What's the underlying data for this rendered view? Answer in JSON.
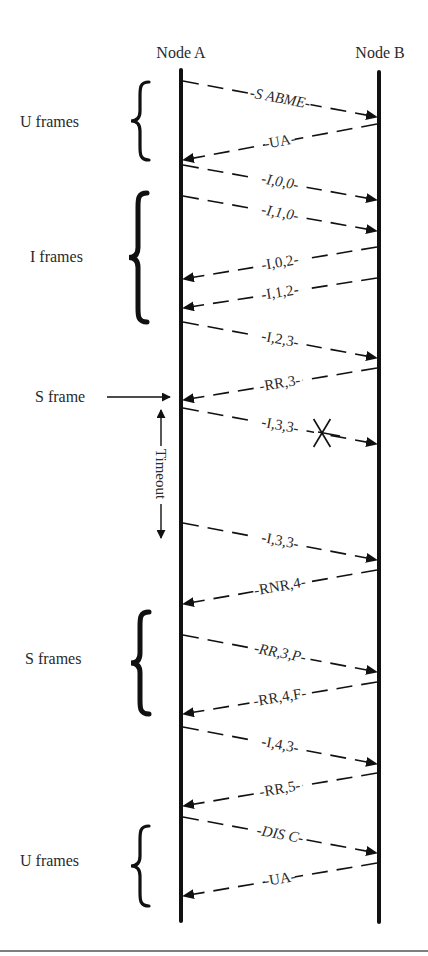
{
  "header_fragment": "",
  "nodes": [
    {
      "id": "A",
      "label": "Node A",
      "x": 181,
      "label_x": 181,
      "label_y": 58,
      "y1": 70,
      "y2": 921
    },
    {
      "id": "B",
      "label": "Node B",
      "x": 379,
      "label_x": 380,
      "label_y": 58,
      "y1": 72,
      "y2": 922
    }
  ],
  "messages": [
    {
      "label": "S ABME",
      "from": "A",
      "to": "B",
      "y1": 81,
      "y2": 117,
      "italic": true,
      "lost": false
    },
    {
      "label": "UA",
      "from": "B",
      "to": "A",
      "y1": 124,
      "y2": 160,
      "italic": false,
      "lost": false
    },
    {
      "label": "I,0,0",
      "from": "A",
      "to": "B",
      "y1": 165,
      "y2": 200,
      "italic": true,
      "lost": false
    },
    {
      "label": "I,1,0",
      "from": "A",
      "to": "B",
      "y1": 196,
      "y2": 231,
      "italic": true,
      "lost": false
    },
    {
      "label": "I,0,2",
      "from": "B",
      "to": "A",
      "y1": 247,
      "y2": 279,
      "italic": false,
      "lost": false
    },
    {
      "label": "I,1,2",
      "from": "B",
      "to": "A",
      "y1": 278,
      "y2": 308,
      "italic": false,
      "lost": false
    },
    {
      "label": "I,2,3",
      "from": "A",
      "to": "B",
      "y1": 322,
      "y2": 358,
      "italic": false,
      "lost": false
    },
    {
      "label": "RR,3",
      "from": "B",
      "to": "A",
      "y1": 368,
      "y2": 400,
      "italic": false,
      "lost": false
    },
    {
      "label": "I,3,3",
      "from": "A",
      "to": "B",
      "y1": 408,
      "y2": 444,
      "italic": false,
      "lost": true
    },
    {
      "label": "I,3,3",
      "from": "A",
      "to": "B",
      "y1": 523,
      "y2": 560,
      "italic": false,
      "lost": false
    },
    {
      "label": "RNR,4",
      "from": "B",
      "to": "A",
      "y1": 570,
      "y2": 604,
      "italic": false,
      "lost": false
    },
    {
      "label": "RR,3,P",
      "from": "A",
      "to": "B",
      "y1": 635,
      "y2": 672,
      "italic": true,
      "lost": false
    },
    {
      "label": "RR,4,F",
      "from": "B",
      "to": "A",
      "y1": 682,
      "y2": 714,
      "italic": false,
      "lost": false
    },
    {
      "label": "I,4,3",
      "from": "A",
      "to": "B",
      "y1": 727,
      "y2": 764,
      "italic": false,
      "lost": false
    },
    {
      "label": "RR,5",
      "from": "B",
      "to": "A",
      "y1": 773,
      "y2": 806,
      "italic": false,
      "lost": false
    },
    {
      "label": "DIS C",
      "from": "A",
      "to": "B",
      "y1": 817,
      "y2": 853,
      "italic": true,
      "lost": false
    },
    {
      "label": "UA",
      "from": "B",
      "to": "A",
      "y1": 863,
      "y2": 896,
      "italic": false,
      "lost": false
    }
  ],
  "groups": [
    {
      "label": "U frames",
      "label_x": 20,
      "label_y": 127,
      "brace_x": 140,
      "y1": 82,
      "y2": 160,
      "thick": false
    },
    {
      "label": "I frames",
      "label_x": 30,
      "label_y": 262,
      "brace_x": 138,
      "y1": 193,
      "y2": 322,
      "thick": true
    },
    {
      "label": "S frames",
      "label_x": 25,
      "label_y": 664,
      "brace_x": 140,
      "y1": 612,
      "y2": 714,
      "thick": true
    },
    {
      "label": "U frames",
      "label_x": 20,
      "label_y": 866,
      "brace_x": 140,
      "y1": 826,
      "y2": 906,
      "thick": false
    }
  ],
  "annotations": {
    "s_frame": {
      "label": "S frame",
      "label_x": 35,
      "label_y": 402,
      "arrow_x1": 107,
      "arrow_x2": 170,
      "arrow_y": 397
    },
    "timeout": {
      "label": "Timeout",
      "x": 161,
      "y1": 410,
      "y2": 538
    },
    "lost_marker": {
      "x": 322,
      "y": 433,
      "size": 14
    }
  },
  "footer_rule": {
    "y": 951,
    "color": "#555555"
  },
  "colors": {
    "line": "#111111",
    "text": "#2a2a2a"
  }
}
